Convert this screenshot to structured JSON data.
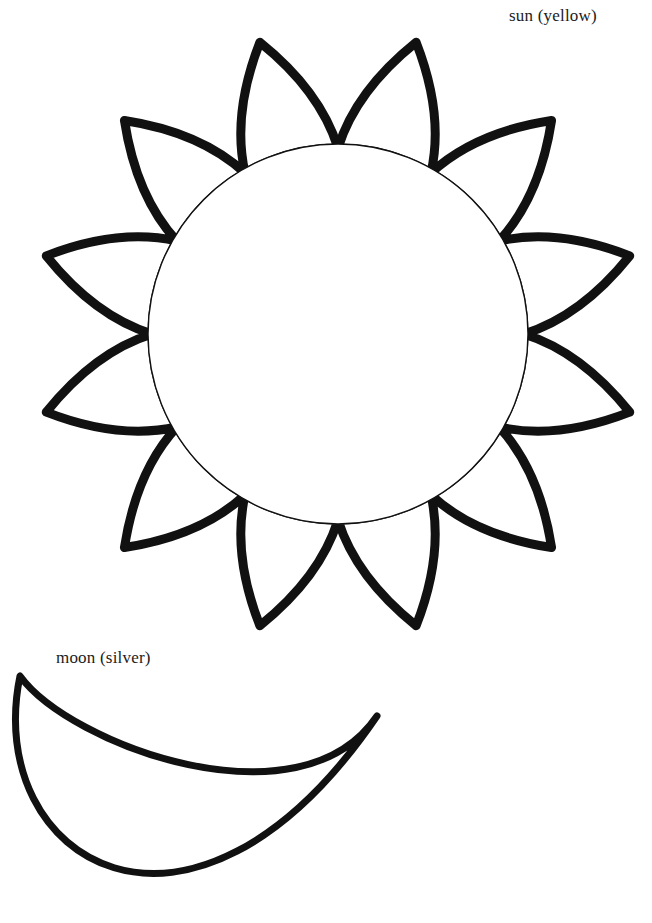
{
  "page": {
    "background_color": "#ffffff",
    "ink_color": "#111111",
    "width": 652,
    "height": 923
  },
  "labels": {
    "sun": "sun (yellow)",
    "moon": "moon (silver)"
  },
  "shapes": {
    "sun": {
      "name": "sun",
      "color_instruction": "yellow",
      "ray_count": 12,
      "center_x": 338,
      "center_y": 334,
      "inner_circle_radius": 190,
      "ray_tip_radius": 302,
      "ray_base_radius": 186,
      "ray_half_angle_deg": 15,
      "ray_angle_offset_deg": 15,
      "outline_stroke_width": 9,
      "inner_circle_stroke_width": 1.4
    },
    "moon": {
      "name": "moon",
      "color_instruction": "silver",
      "outer_arc": {
        "start_x": 20,
        "start_y": 676,
        "end_x": 377,
        "end_y": 716,
        "control1_x": -18,
        "control1_y": 860,
        "control2_x": 190,
        "control2_y": 990
      },
      "inner_arc": {
        "control1_x": 300,
        "control1_y": 830,
        "control2_x": 70,
        "control2_y": 745
      },
      "outline_stroke_width": 7
    }
  }
}
